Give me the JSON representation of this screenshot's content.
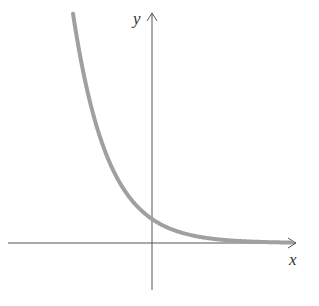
{
  "chart_data": {
    "type": "line",
    "title": "",
    "xlabel": "x",
    "ylabel": "y",
    "function": "y = e^(-x)",
    "series": [
      {
        "name": "y = e^(-x)",
        "x": [
          -2.25,
          -2,
          -1.5,
          -1,
          -0.5,
          0,
          0.5,
          1,
          1.5,
          2,
          2.5,
          3,
          3.5,
          4
        ],
        "values": [
          9.49,
          7.39,
          4.48,
          2.72,
          1.65,
          1.0,
          0.61,
          0.37,
          0.22,
          0.14,
          0.08,
          0.05,
          0.03,
          0.02
        ]
      }
    ],
    "grid": false,
    "legend": "none",
    "axis_ticks": "none",
    "colors": {
      "curve": "#a0a0a0",
      "axes": "#555555"
    }
  },
  "labels": {
    "x_axis": "x",
    "y_axis": "y"
  }
}
